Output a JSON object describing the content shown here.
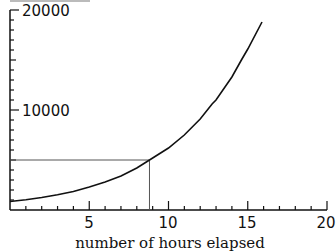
{
  "chart_data": {
    "type": "line",
    "title": "",
    "xlabel": "number of hours elapsed",
    "ylabel": "",
    "xlim": [
      0,
      20
    ],
    "ylim": [
      0,
      20000
    ],
    "x_ticks": [
      5,
      10,
      15,
      20
    ],
    "x_tick_labels": [
      "5",
      "10",
      "15",
      "20"
    ],
    "x_minor_tick_step": 1,
    "y_ticks": [
      10000,
      20000
    ],
    "y_tick_labels": [
      "10000",
      "20000"
    ],
    "y_minor_tick_step": 1000,
    "grid": false,
    "legend": null,
    "series": [
      {
        "name": "exponential growth curve",
        "color": "#111111",
        "x": [
          0,
          1,
          2,
          3,
          4,
          5,
          6,
          7,
          8,
          8.8,
          10,
          11,
          12,
          12.75,
          13,
          14,
          14.6,
          15,
          15.9
        ],
        "y": [
          850,
          1030,
          1250,
          1520,
          1850,
          2300,
          2800,
          3400,
          4200,
          5000,
          6200,
          7500,
          9100,
          10600,
          11000,
          13300,
          15000,
          16100,
          18800
        ]
      }
    ],
    "annotations": [
      {
        "type": "hline",
        "y": 5000,
        "x_from": 0,
        "x_to": 8.8,
        "color": "#555555"
      },
      {
        "type": "vline",
        "x": 8.8,
        "y_from": 0,
        "y_to": 5000,
        "color": "#555555"
      }
    ]
  },
  "labels": {
    "xlabel": "number of hours elapsed",
    "x_ticks": [
      "5",
      "10",
      "15",
      "20"
    ],
    "y_ticks": [
      "10000",
      "20000"
    ]
  }
}
